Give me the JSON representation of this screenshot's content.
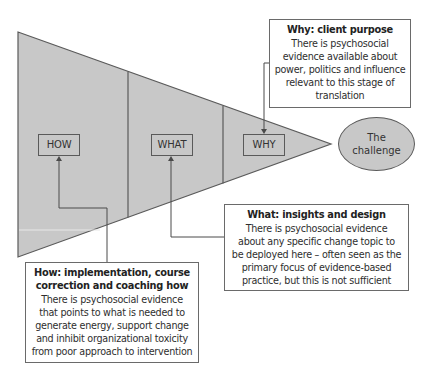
{
  "diagram": {
    "colors": {
      "fill": "#c8c8c8",
      "stroke": "#5a5a5a",
      "text": "#2a2a2a",
      "background": "#ffffff"
    },
    "funnel": {
      "sections": [
        {
          "id": "how",
          "label": "HOW"
        },
        {
          "id": "what",
          "label": "WHAT"
        },
        {
          "id": "why",
          "label": "WHY"
        }
      ]
    },
    "target": {
      "label": "The\nchallenge"
    },
    "callouts": {
      "why": {
        "title": "Why: client purpose",
        "body": "There is psychosocial\nevidence available about\npower, politics and influence\nrelevant to this stage of\ntranslation"
      },
      "what": {
        "title": "What: insights and design",
        "body": "There is psychosocial evidence\nabout any specific change topic to\nbe deployed here – often seen as the\nprimary focus of evidence-based\npractice, but this is not sufficient"
      },
      "how": {
        "title": "How: implementation, course\ncorrection and coaching how",
        "body": "There is psychosocial evidence\nthat points to what is needed to\ngenerate energy, support change\nand inhibit organizational toxicity\nfrom poor approach to intervention"
      }
    }
  }
}
